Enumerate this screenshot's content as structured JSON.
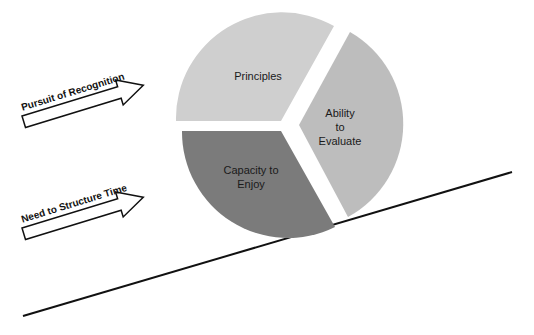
{
  "diagram": {
    "pie": {
      "segments": [
        {
          "label": "Principles",
          "color": "#cfcfcf"
        },
        {
          "label_lines": [
            "Ability",
            "to",
            "Evaluate"
          ],
          "color": "#bdbdbd"
        },
        {
          "label_lines": [
            "Capacity to",
            "Enjoy"
          ],
          "color": "#7b7b7b"
        }
      ]
    },
    "arrows": [
      {
        "label": "Pursuit of Recognition"
      },
      {
        "label": "Need to Structure Time"
      }
    ],
    "incline_line": {
      "color": "#111111"
    }
  }
}
